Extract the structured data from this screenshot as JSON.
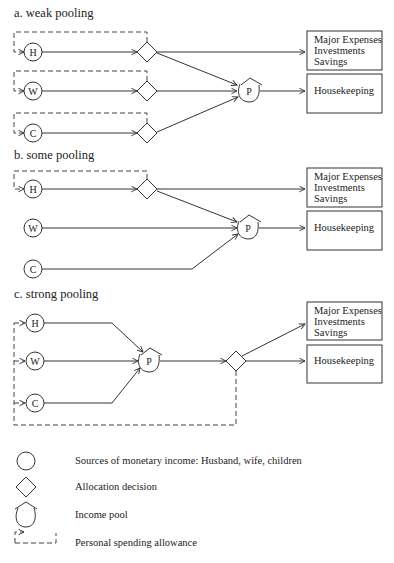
{
  "sections": [
    {
      "title": "a. weak pooling",
      "sources": [
        {
          "label": "H",
          "name": "Husband"
        },
        {
          "label": "W",
          "name": "Wife"
        },
        {
          "label": "C",
          "name": "Children"
        }
      ],
      "pool_label": "P",
      "outputs": {
        "major": [
          "Major Expenses",
          "Investments",
          "Savings"
        ],
        "housekeeping": "Housekeeping"
      }
    },
    {
      "title": "b. some pooling",
      "sources": [
        {
          "label": "H",
          "name": "Husband"
        },
        {
          "label": "W",
          "name": "Wife"
        },
        {
          "label": "C",
          "name": "Children"
        }
      ],
      "pool_label": "P",
      "outputs": {
        "major": [
          "Major Expenses",
          "Investments",
          "Savings"
        ],
        "housekeeping": "Housekeeping"
      }
    },
    {
      "title": "c. strong pooling",
      "sources": [
        {
          "label": "H",
          "name": "Husband"
        },
        {
          "label": "W",
          "name": "Wife"
        },
        {
          "label": "C",
          "name": "Children"
        }
      ],
      "pool_label": "P",
      "outputs": {
        "major": [
          "Major Expenses",
          "Investments",
          "Savings"
        ],
        "housekeeping": "Housekeeping"
      }
    }
  ],
  "legend": [
    {
      "symbol": "circle",
      "label": "Sources of monetary income:  Husband, wife, children"
    },
    {
      "symbol": "diamond",
      "label": "Allocation decision"
    },
    {
      "symbol": "income-pool",
      "label": "Income pool"
    },
    {
      "symbol": "dashed-bracket",
      "label": "Personal spending allowance"
    }
  ]
}
